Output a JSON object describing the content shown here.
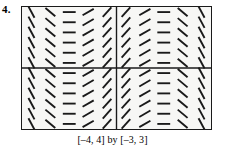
{
  "problem": {
    "number": "4."
  },
  "caption": {
    "text": "[–4, 4] by [–3, 3]"
  },
  "colors": {
    "segment": "#1a1a1a",
    "frame": "#1a1a1a",
    "axis": "#1a1a1a",
    "plot_background": "#f7f7f5",
    "page_background": "#ffffff"
  },
  "chart_data": {
    "type": "scatter",
    "subtype": "slope-field",
    "title": "",
    "xlabel": "",
    "ylabel": "",
    "xlim": [
      -4,
      4
    ],
    "ylim": [
      -3,
      3
    ],
    "grid": false,
    "legend": null,
    "axes_drawn": [
      "x-axis at y=0",
      "y-axis at x=0"
    ],
    "frame": true,
    "columns": 10,
    "rows": 12,
    "x": [
      -3.6,
      -2.8,
      -2.0,
      -1.2,
      -0.4,
      0.4,
      1.2,
      2.0,
      2.8,
      3.6
    ],
    "y": [
      2.75,
      2.25,
      1.75,
      1.25,
      0.75,
      0.25,
      -0.25,
      -0.75,
      -1.25,
      -1.75,
      -2.25,
      -2.75
    ],
    "slope_angles_deg_per_column": [
      -62,
      -40,
      0,
      30,
      48,
      48,
      30,
      0,
      -40,
      -62
    ],
    "note": "Slope depends only on x; every row in a column shows the same tick angle. Pattern is symmetric about x = 0 with horizontal ticks at x ≈ ±2.",
    "segment_length_px": 13
  }
}
